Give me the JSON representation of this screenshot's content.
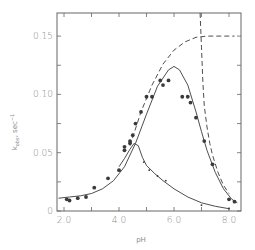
{
  "chart_data": {
    "type": "scatter",
    "title": "",
    "xlabel": "pH",
    "ylabel": "k_obs, sec^-1",
    "xlim": [
      1.8,
      8.3
    ],
    "ylim": [
      0,
      0.17
    ],
    "grid": false,
    "legend": null,
    "x_ticks": [
      {
        "value": 2.0,
        "label": "2.0"
      },
      {
        "value": 3.0,
        "label": ""
      },
      {
        "value": 4.0,
        "label": "4.0"
      },
      {
        "value": 5.0,
        "label": ""
      },
      {
        "value": 6.0,
        "label": "6.0"
      },
      {
        "value": 7.0,
        "label": ""
      },
      {
        "value": 8.0,
        "label": "8.0"
      }
    ],
    "y_ticks": [
      {
        "value": 0,
        "label": "0"
      },
      {
        "value": 0.025,
        "label": ""
      },
      {
        "value": 0.05,
        "label": "0.05"
      },
      {
        "value": 0.075,
        "label": ""
      },
      {
        "value": 0.1,
        "label": "0.10"
      },
      {
        "value": 0.125,
        "label": ""
      },
      {
        "value": 0.15,
        "label": "0.15"
      }
    ],
    "series": [
      {
        "name": "observed (filled circles)",
        "kind": "points",
        "marker": "filled",
        "x": [
          2.1,
          2.2,
          2.5,
          2.8,
          3.1,
          3.6,
          4.0,
          4.2,
          4.2,
          4.4,
          4.4,
          4.5,
          4.6,
          4.8,
          5.0,
          5.2,
          5.5,
          5.6,
          5.8,
          6.3,
          6.5,
          6.6,
          6.8,
          7.1,
          7.4,
          8.0,
          8.2
        ],
        "y": [
          0.01,
          0.009,
          0.011,
          0.012,
          0.02,
          0.028,
          0.035,
          0.052,
          0.055,
          0.058,
          0.06,
          0.065,
          0.075,
          0.085,
          0.098,
          0.098,
          0.112,
          0.108,
          0.112,
          0.098,
          0.098,
          0.093,
          0.08,
          0.06,
          0.04,
          0.01,
          0.008
        ]
      },
      {
        "name": "observed (small points, lower branch)",
        "kind": "points",
        "marker": "small",
        "x": [
          4.9,
          5.1,
          5.4,
          5.7,
          7.0,
          8.0
        ],
        "y": [
          0.042,
          0.035,
          0.03,
          0.026,
          0.005,
          0.002
        ]
      },
      {
        "name": "fit, bell curve (solid)",
        "kind": "line",
        "style": "solid",
        "x": [
          1.8,
          2.2,
          2.6,
          3.0,
          3.4,
          3.8,
          4.2,
          4.6,
          5.0,
          5.4,
          5.8,
          6.0,
          6.2,
          6.5,
          6.8,
          7.0,
          7.2,
          7.5,
          7.8,
          8.1,
          8.3
        ],
        "y": [
          0.011,
          0.012,
          0.013,
          0.015,
          0.019,
          0.026,
          0.038,
          0.058,
          0.083,
          0.107,
          0.121,
          0.124,
          0.121,
          0.108,
          0.085,
          0.068,
          0.052,
          0.033,
          0.019,
          0.01,
          0.007
        ]
      },
      {
        "name": "fit, lower peak (solid)",
        "kind": "line",
        "style": "solid",
        "x": [
          4.0,
          4.2,
          4.4,
          4.55,
          4.7,
          4.85,
          5.0,
          5.3,
          5.6,
          6.0,
          6.5,
          7.0,
          7.5,
          8.0
        ],
        "y": [
          0.038,
          0.045,
          0.053,
          0.058,
          0.056,
          0.046,
          0.039,
          0.032,
          0.026,
          0.019,
          0.012,
          0.007,
          0.004,
          0.002
        ]
      },
      {
        "name": "asymptote curve (dashed)",
        "kind": "line",
        "style": "dashed",
        "x": [
          4.4,
          4.8,
          5.2,
          5.6,
          6.0,
          6.4,
          6.8,
          7.2,
          7.6,
          8.0,
          8.2
        ],
        "y": [
          0.056,
          0.085,
          0.108,
          0.126,
          0.138,
          0.145,
          0.149,
          0.15,
          0.15,
          0.15,
          0.15
        ]
      },
      {
        "name": "steep descending (dashed)",
        "kind": "line",
        "style": "dashed",
        "x": [
          6.95,
          7.0,
          7.05,
          7.1,
          7.2,
          7.3,
          7.4,
          7.6,
          7.8,
          8.0
        ],
        "y": [
          0.17,
          0.14,
          0.11,
          0.09,
          0.072,
          0.058,
          0.048,
          0.033,
          0.022,
          0.015
        ]
      }
    ]
  }
}
